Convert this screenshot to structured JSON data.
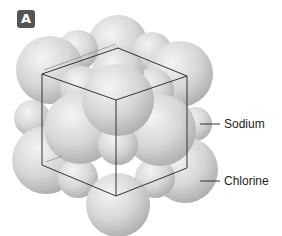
{
  "figure": {
    "panel_label": "A",
    "labels": [
      {
        "text": "Sodium",
        "x": 224,
        "y": 118,
        "line": {
          "x1": 200,
          "y1": 124,
          "x2": 220,
          "y2": 124
        }
      },
      {
        "text": "Chlorine",
        "x": 224,
        "y": 175,
        "line": {
          "x1": 200,
          "y1": 181,
          "x2": 220,
          "y2": 181
        }
      }
    ],
    "colors": {
      "sphere_light": "#efefef",
      "sphere_mid": "#cfcfcf",
      "sphere_dark": "#a8a8a8",
      "cube_line": "#333333",
      "badge_bg": "#555555",
      "badge_text": "#ffffff"
    }
  }
}
